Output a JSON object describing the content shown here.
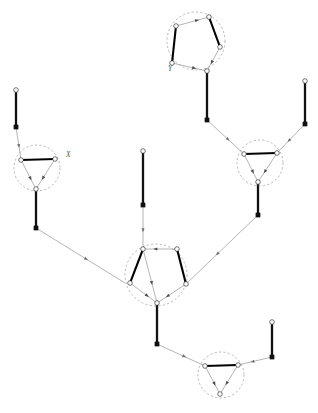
{
  "figure": {
    "title": "",
    "background_color": "#ffffff",
    "width": 318,
    "height": 413
  },
  "style": {
    "ring_stroke": "#9a9a9a",
    "thick_edge_color": "#000000",
    "thin_edge_color": "#8c8c8c",
    "node_fill": "#ffffff",
    "node_stroke": "#3a3a3a",
    "square_fill": "#111111",
    "arrow_fill": "#6e6e6e",
    "label_color": "#555555"
  },
  "labels": [
    {
      "id": "label-X",
      "text": "X",
      "x": 66,
      "y": 157
    },
    {
      "id": "label-Y",
      "text": "Y",
      "x": 168,
      "y": 71
    }
  ],
  "clusters": [
    {
      "id": "cluster-top-pentagon",
      "shape": "pentagon",
      "ring": {
        "cx": 196,
        "cy": 41,
        "r": 29
      },
      "nodes": [
        {
          "id": "tp-a",
          "x": 209,
          "y": 17,
          "type": "open"
        },
        {
          "id": "tp-b",
          "x": 176,
          "y": 26,
          "type": "open"
        },
        {
          "id": "tp-c",
          "x": 172,
          "y": 63,
          "type": "open"
        },
        {
          "id": "tp-d",
          "x": 207,
          "y": 71,
          "type": "open"
        },
        {
          "id": "tp-e",
          "x": 220,
          "y": 47,
          "type": "open"
        }
      ],
      "thick_edges": [
        [
          "tp-b",
          "tp-c"
        ],
        [
          "tp-a",
          "tp-e"
        ]
      ],
      "thin_edges": [
        [
          "tp-b",
          "tp-a"
        ],
        [
          "tp-c",
          "tp-d"
        ],
        [
          "tp-e",
          "tp-d"
        ]
      ]
    },
    {
      "id": "cluster-left-triangle",
      "shape": "triangle",
      "ring": {
        "cx": 37,
        "cy": 168,
        "r": 23
      },
      "nodes": [
        {
          "id": "lt-a",
          "x": 21,
          "y": 160,
          "type": "open"
        },
        {
          "id": "lt-b",
          "x": 55,
          "y": 159,
          "type": "open"
        },
        {
          "id": "lt-c",
          "x": 36,
          "y": 189,
          "type": "open"
        }
      ],
      "thick_edges": [
        [
          "lt-a",
          "lt-b"
        ]
      ],
      "thin_edges": [
        [
          "lt-a",
          "lt-c"
        ],
        [
          "lt-b",
          "lt-c"
        ]
      ]
    },
    {
      "id": "cluster-right-triangle",
      "shape": "triangle",
      "ring": {
        "cx": 260,
        "cy": 163,
        "r": 23
      },
      "nodes": [
        {
          "id": "rt-a",
          "x": 244,
          "y": 154,
          "type": "open"
        },
        {
          "id": "rt-b",
          "x": 277,
          "y": 153,
          "type": "open"
        },
        {
          "id": "rt-c",
          "x": 258,
          "y": 182,
          "type": "open"
        }
      ],
      "thick_edges": [
        [
          "rt-a",
          "rt-b"
        ]
      ],
      "thin_edges": [
        [
          "rt-a",
          "rt-c"
        ],
        [
          "rt-b",
          "rt-c"
        ]
      ]
    },
    {
      "id": "cluster-middle-pentagon",
      "shape": "pentagon",
      "ring": {
        "cx": 156,
        "cy": 275,
        "r": 31
      },
      "nodes": [
        {
          "id": "mp-a",
          "x": 143,
          "y": 249,
          "type": "open"
        },
        {
          "id": "mp-b",
          "x": 177,
          "y": 249,
          "type": "open"
        },
        {
          "id": "mp-c",
          "x": 186,
          "y": 284,
          "type": "open"
        },
        {
          "id": "mp-d",
          "x": 157,
          "y": 303,
          "type": "open"
        },
        {
          "id": "mp-e",
          "x": 130,
          "y": 283,
          "type": "open"
        }
      ],
      "thick_edges": [
        [
          "mp-a",
          "mp-e"
        ],
        [
          "mp-b",
          "mp-c"
        ]
      ],
      "thin_edges": [
        [
          "mp-b",
          "mp-a"
        ],
        [
          "mp-a",
          "mp-d"
        ],
        [
          "mp-e",
          "mp-d"
        ],
        [
          "mp-c",
          "mp-d"
        ]
      ]
    },
    {
      "id": "cluster-bottom-triangle",
      "shape": "triangle",
      "ring": {
        "cx": 221,
        "cy": 375,
        "r": 23
      },
      "nodes": [
        {
          "id": "bt-a",
          "x": 205,
          "y": 366,
          "type": "open"
        },
        {
          "id": "bt-b",
          "x": 238,
          "y": 365,
          "type": "open"
        },
        {
          "id": "bt-c",
          "x": 220,
          "y": 394,
          "type": "open"
        }
      ],
      "thick_edges": [
        [
          "bt-a",
          "bt-b"
        ]
      ],
      "thin_edges": [
        [
          "bt-a",
          "bt-c"
        ],
        [
          "bt-b",
          "bt-c"
        ]
      ]
    }
  ],
  "pendants": [
    {
      "id": "pendant-left-top",
      "tip": {
        "x": 16,
        "y": 90,
        "type": "open"
      },
      "joint": {
        "x": 16,
        "y": 127,
        "type": "square"
      },
      "target": {
        "x": 21,
        "y": 160
      }
    },
    {
      "id": "pendant-left-down",
      "tip": {
        "x": 36,
        "y": 189,
        "type": "attached"
      },
      "joint": {
        "x": 36,
        "y": 228,
        "type": "square"
      },
      "target": {
        "x": 125,
        "y": 283
      }
    },
    {
      "id": "pendant-center-top",
      "tip": {
        "x": 143,
        "y": 151,
        "type": "open"
      },
      "joint": {
        "x": 143,
        "y": 205,
        "type": "square"
      },
      "target": {
        "x": 143,
        "y": 249
      }
    },
    {
      "id": "pendant-top-pentagon-down",
      "tip": {
        "x": 207,
        "y": 71,
        "type": "attached"
      },
      "joint": {
        "x": 207,
        "y": 120,
        "type": "square"
      },
      "target": {
        "x": 244,
        "y": 154
      }
    },
    {
      "id": "pendant-right-top",
      "tip": {
        "x": 305,
        "y": 81,
        "type": "open"
      },
      "joint": {
        "x": 305,
        "y": 124,
        "type": "square"
      },
      "target": {
        "x": 277,
        "y": 153
      }
    },
    {
      "id": "pendant-right-triangle-down",
      "tip": {
        "x": 258,
        "y": 182,
        "type": "attached"
      },
      "joint": {
        "x": 258,
        "y": 215,
        "type": "square"
      },
      "target": {
        "x": 186,
        "y": 284
      }
    },
    {
      "id": "pendant-middle-down",
      "tip": {
        "x": 157,
        "y": 303,
        "type": "attached"
      },
      "joint": {
        "x": 157,
        "y": 344,
        "type": "square"
      },
      "target": {
        "x": 205,
        "y": 366
      }
    },
    {
      "id": "pendant-bottom-right",
      "tip": {
        "x": 272,
        "y": 322,
        "type": "open"
      },
      "joint": {
        "x": 272,
        "y": 357,
        "type": "square"
      },
      "target": {
        "x": 238,
        "y": 365
      }
    }
  ],
  "summary": {
    "cluster_count": 5,
    "pendant_count": 8,
    "triangle_count": 3,
    "pentagon_count": 2
  }
}
